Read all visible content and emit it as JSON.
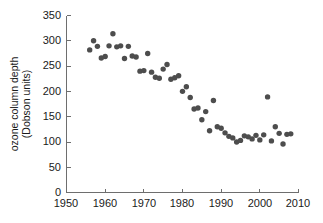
{
  "chart_data": {
    "type": "scatter",
    "title": "",
    "subtitle": "",
    "xlabel": "",
    "ylabel": "ozone column depth (Dobson units)",
    "ylabel_line1": "ozone column depth",
    "ylabel_line2": "(Dobson units)",
    "xlim": [
      1950,
      2010
    ],
    "ylim": [
      0,
      350
    ],
    "xticks": [
      1950,
      1960,
      1970,
      1980,
      1990,
      2000,
      2010
    ],
    "xticklabels": [
      "1950",
      "1960",
      "1970",
      "1980",
      "1990",
      "2000",
      "2010"
    ],
    "yticks": [
      0,
      50,
      100,
      150,
      200,
      250,
      300,
      350
    ],
    "yticklabels": [
      "0",
      "50",
      "100",
      "150",
      "200",
      "250",
      "300",
      "350"
    ],
    "grid": false,
    "legend": null,
    "marker": "circle",
    "marker_color": "#4d4d4d",
    "marker_size": 4,
    "x": [
      1956,
      1957,
      1958,
      1959,
      1960,
      1961,
      1962,
      1963,
      1964,
      1965,
      1966,
      1967,
      1968,
      1969,
      1970,
      1971,
      1972,
      1973,
      1974,
      1975,
      1976,
      1977,
      1978,
      1979,
      1980,
      1981,
      1982,
      1983,
      1984,
      1985,
      1986,
      1987,
      1988,
      1989,
      1990,
      1991,
      1992,
      1993,
      1994,
      1995,
      1996,
      1997,
      1998,
      1999,
      2000,
      2001,
      2002,
      2003,
      2004,
      2005,
      2006,
      2007,
      2008
    ],
    "y": [
      282,
      300,
      289,
      266,
      269,
      290,
      314,
      288,
      290,
      265,
      289,
      270,
      268,
      240,
      241,
      275,
      238,
      228,
      226,
      244,
      253,
      224,
      227,
      231,
      200,
      209,
      188,
      165,
      167,
      144,
      160,
      122,
      182,
      130,
      127,
      118,
      111,
      108,
      100,
      103,
      112,
      110,
      106,
      113,
      104,
      114,
      189,
      102,
      130,
      117,
      96,
      115,
      116
    ]
  },
  "axis": {
    "y_tick_0": "0",
    "y_tick_50": "50",
    "y_tick_100": "100",
    "y_tick_150": "150",
    "y_tick_200": "200",
    "y_tick_250": "250",
    "y_tick_300": "300",
    "y_tick_350": "350",
    "x_tick_1950": "1950",
    "x_tick_1960": "1960",
    "x_tick_1970": "1970",
    "x_tick_1980": "1980",
    "x_tick_1990": "1990",
    "x_tick_2000": "2000",
    "x_tick_2010": "2010"
  }
}
